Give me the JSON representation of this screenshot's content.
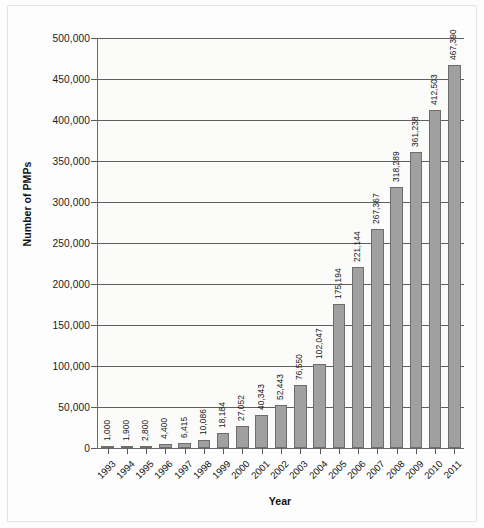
{
  "chart_data": {
    "type": "bar",
    "title": "",
    "xlabel": "Year",
    "ylabel": "Number of PMPs",
    "categories": [
      "1993",
      "1994",
      "1995",
      "1996",
      "1997",
      "1998",
      "1999",
      "2000",
      "2001",
      "2002",
      "2003",
      "2004",
      "2005",
      "2006",
      "2007",
      "2008",
      "2009",
      "2010",
      "2011"
    ],
    "values": [
      1000,
      1900,
      2800,
      4400,
      6415,
      10086,
      18184,
      27052,
      40343,
      52443,
      76550,
      102047,
      175194,
      221144,
      267367,
      318289,
      361238,
      412503,
      467390
    ],
    "value_labels": [
      "1,000",
      "1,900",
      "2,800",
      "4,400",
      "6,415",
      "10,086",
      "18,184",
      "27,052",
      "40,343",
      "52,443",
      "76,550",
      "102,047",
      "175,194",
      "221,144",
      "267,367",
      "318,289",
      "361,238",
      "412,503",
      "467,390"
    ],
    "ylim": [
      0,
      500000
    ],
    "ytick_values": [
      0,
      50000,
      100000,
      150000,
      200000,
      250000,
      300000,
      350000,
      400000,
      450000,
      500000
    ],
    "ytick_labels": [
      "0",
      "50,000",
      "100,000",
      "150,000",
      "200,000",
      "250,000",
      "300,000",
      "350,000",
      "400,000",
      "450,000",
      "500,000"
    ],
    "grid": "horizontal",
    "legend": "none",
    "bar_color": "#a0a0a0",
    "bar_border_color": "#6d6d6d",
    "axis_color": "#5f5f5f",
    "plot_background": "#fbfbfa"
  }
}
